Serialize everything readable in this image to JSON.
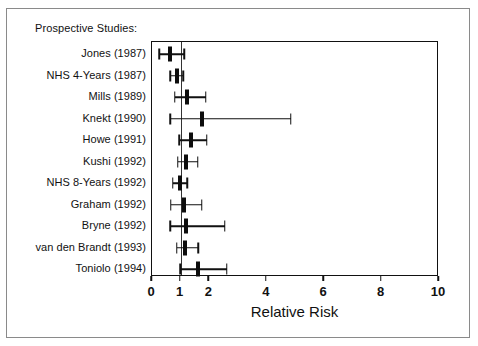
{
  "figure": {
    "title": "Prospective Studies:",
    "xlabel": "Relative Risk",
    "frame_color": "#8a8a8a",
    "axis_color": "#111111",
    "marker_color": "#0d0d0d"
  },
  "chart_data": {
    "type": "forest",
    "title": "Prospective Studies:",
    "xlabel": "Relative Risk",
    "ylabel": "",
    "xlim": [
      0,
      10
    ],
    "xticks": [
      0,
      1,
      2,
      4,
      6,
      8,
      10
    ],
    "xtick_labels": [
      "0",
      "1",
      "2",
      "4",
      "6",
      "8",
      "10"
    ],
    "grid": false,
    "reference_line": 1,
    "categories": [
      "Jones (1987)",
      "NHS 4-Years (1987)",
      "Mills (1989)",
      "Knekt (1990)",
      "Howe (1991)",
      "Kushi (1992)",
      "NHS 8-Years (1992)",
      "Graham (1992)",
      "Bryne (1992)",
      "van den Brandt (1993)",
      "Toniolo (1994)"
    ],
    "values": [
      0.63,
      0.87,
      1.22,
      1.73,
      1.37,
      1.17,
      0.99,
      1.13,
      1.17,
      1.15,
      1.59
    ],
    "ci_low": [
      0.25,
      0.63,
      0.8,
      0.63,
      0.95,
      0.9,
      0.73,
      0.66,
      0.63,
      0.87,
      0.98
    ],
    "ci_high": [
      1.13,
      1.09,
      1.88,
      4.84,
      1.91,
      1.59,
      1.22,
      1.73,
      2.54,
      1.61,
      2.61
    ],
    "points": [
      {
        "label": "Jones (1987)",
        "rr": 0.63,
        "low": 0.25,
        "high": 1.13
      },
      {
        "label": "NHS 4-Years (1987)",
        "rr": 0.87,
        "low": 0.63,
        "high": 1.09
      },
      {
        "label": "Mills (1989)",
        "rr": 1.22,
        "low": 0.8,
        "high": 1.88
      },
      {
        "label": "Knekt (1990)",
        "rr": 1.73,
        "low": 0.63,
        "high": 4.84
      },
      {
        "label": "Howe (1991)",
        "rr": 1.37,
        "low": 0.95,
        "high": 1.91
      },
      {
        "label": "Kushi (1992)",
        "rr": 1.17,
        "low": 0.9,
        "high": 1.59
      },
      {
        "label": "NHS 8-Years (1992)",
        "rr": 0.99,
        "low": 0.73,
        "high": 1.22
      },
      {
        "label": "Graham (1992)",
        "rr": 1.13,
        "low": 0.66,
        "high": 1.73
      },
      {
        "label": "Bryne (1992)",
        "rr": 1.17,
        "low": 0.63,
        "high": 2.54
      },
      {
        "label": "van den Brandt (1993)",
        "rr": 1.15,
        "low": 0.87,
        "high": 1.61
      },
      {
        "label": "Toniolo (1994)",
        "rr": 1.59,
        "low": 0.98,
        "high": 2.61
      }
    ]
  }
}
